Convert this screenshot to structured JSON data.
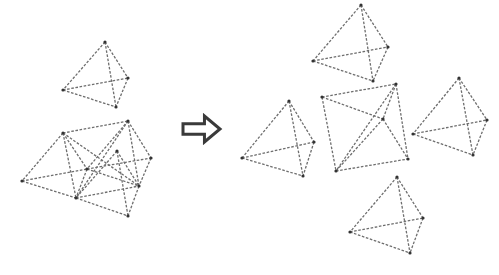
{
  "diagram": {
    "colors": {
      "edge": "#6e6e6e",
      "vertex": "#333333",
      "arrow": "#3a3a3a",
      "background": "#ffffff"
    },
    "arrow": {
      "icon": "right-outline-arrow",
      "x": 183,
      "y": 116,
      "width": 37,
      "height": 26
    },
    "groups": [
      {
        "name": "single-tetrahedron-left",
        "vertices": [
          [
            105,
            42
          ],
          [
            128,
            78
          ],
          [
            63,
            90
          ],
          [
            116,
            107
          ]
        ],
        "edges": [
          [
            0,
            1
          ],
          [
            0,
            2
          ],
          [
            0,
            3
          ],
          [
            2,
            1
          ],
          [
            2,
            3
          ],
          [
            1,
            3
          ]
        ]
      },
      {
        "name": "merged-cluster-left",
        "vertices": [
          [
            128,
            121
          ],
          [
            63,
            133
          ],
          [
            117,
            151
          ],
          [
            151,
            158
          ],
          [
            87,
            169
          ],
          [
            22,
            181
          ],
          [
            139,
            186
          ],
          [
            76,
            198
          ],
          [
            128,
            216
          ]
        ],
        "edges": [
          [
            1,
            0
          ],
          [
            1,
            6
          ],
          [
            1,
            7
          ],
          [
            0,
            7
          ],
          [
            0,
            6
          ],
          [
            7,
            6
          ],
          [
            1,
            5
          ],
          [
            5,
            4
          ],
          [
            5,
            7
          ],
          [
            4,
            7
          ],
          [
            1,
            4
          ],
          [
            0,
            4
          ],
          [
            0,
            3
          ],
          [
            4,
            3
          ],
          [
            4,
            6
          ],
          [
            3,
            6
          ],
          [
            2,
            7
          ],
          [
            2,
            8
          ],
          [
            7,
            8
          ],
          [
            6,
            8
          ],
          [
            2,
            6
          ]
        ]
      },
      {
        "name": "tetrahedron-top-right",
        "vertices": [
          [
            361,
            5
          ],
          [
            388,
            47
          ],
          [
            313,
            61
          ],
          [
            373,
            81
          ]
        ],
        "edges": [
          [
            0,
            1
          ],
          [
            0,
            2
          ],
          [
            0,
            3
          ],
          [
            2,
            1
          ],
          [
            2,
            3
          ],
          [
            1,
            3
          ]
        ]
      },
      {
        "name": "tetrahedron-left-right",
        "vertices": [
          [
            289,
            101
          ],
          [
            314,
            142
          ],
          [
            242,
            158
          ],
          [
            303,
            176
          ]
        ],
        "edges": [
          [
            0,
            1
          ],
          [
            0,
            2
          ],
          [
            0,
            3
          ],
          [
            2,
            1
          ],
          [
            2,
            3
          ],
          [
            1,
            3
          ]
        ]
      },
      {
        "name": "tetrahedron-center-right",
        "vertices": [
          [
            322,
            97
          ],
          [
            396,
            84
          ],
          [
            408,
            159
          ],
          [
            336,
            171
          ],
          [
            383,
            119
          ]
        ],
        "edges": [
          [
            0,
            1
          ],
          [
            0,
            3
          ],
          [
            1,
            2
          ],
          [
            3,
            2
          ],
          [
            0,
            4
          ],
          [
            4,
            2
          ],
          [
            1,
            3
          ],
          [
            4,
            3
          ],
          [
            1,
            4
          ]
        ]
      },
      {
        "name": "tetrahedron-far-right",
        "vertices": [
          [
            459,
            78
          ],
          [
            487,
            120
          ],
          [
            413,
            134
          ],
          [
            473,
            155
          ]
        ],
        "edges": [
          [
            0,
            1
          ],
          [
            0,
            2
          ],
          [
            0,
            3
          ],
          [
            2,
            1
          ],
          [
            2,
            3
          ],
          [
            1,
            3
          ]
        ]
      },
      {
        "name": "tetrahedron-bottom-right",
        "vertices": [
          [
            397,
            177
          ],
          [
            423,
            218
          ],
          [
            350,
            232
          ],
          [
            410,
            253
          ]
        ],
        "edges": [
          [
            0,
            1
          ],
          [
            0,
            2
          ],
          [
            0,
            3
          ],
          [
            2,
            1
          ],
          [
            2,
            3
          ],
          [
            1,
            3
          ]
        ]
      }
    ]
  }
}
